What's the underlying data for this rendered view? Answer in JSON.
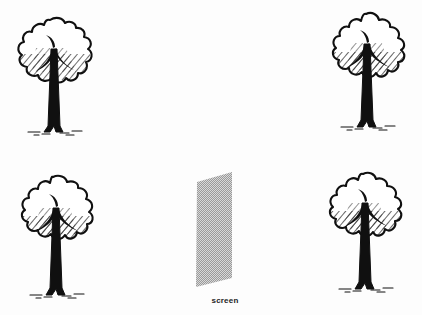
{
  "figure": {
    "title": "",
    "background_color": "#fdfdfd",
    "width": 422,
    "height": 315,
    "ink_color": "#101010",
    "screen_fill_color": "#b8b8b8"
  },
  "screen": {
    "label": "screen",
    "shape": "parallelogram",
    "fill": "#b8b8b8",
    "texture": "halftone-dots",
    "corners": [
      [
        197,
        182
      ],
      [
        232,
        172
      ],
      [
        232,
        278
      ],
      [
        196,
        287
      ]
    ]
  },
  "trees": [
    {
      "name": "tree-top-left",
      "position": "top-left",
      "x": 6,
      "y": 14,
      "width": 96,
      "height": 134
    },
    {
      "name": "tree-top-right",
      "position": "top-right",
      "x": 318,
      "y": 10,
      "width": 96,
      "height": 134
    },
    {
      "name": "tree-bottom-left",
      "position": "bottom-left",
      "x": 8,
      "y": 172,
      "width": 96,
      "height": 134
    },
    {
      "name": "tree-bottom-right",
      "position": "bottom-right",
      "x": 316,
      "y": 168,
      "width": 96,
      "height": 134
    }
  ]
}
